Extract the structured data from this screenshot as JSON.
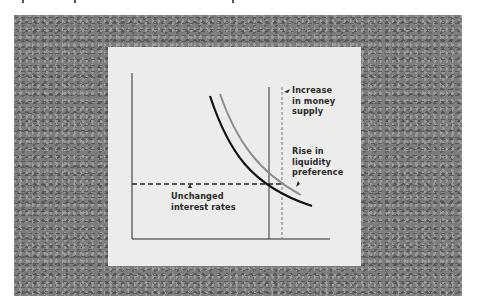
{
  "figure": {
    "type": "liquidity-trap diagram",
    "labels": {
      "money_supply": "Increase\nin money\nsupply",
      "liquidity": "Rise in\nliquidity\npreference",
      "interest": "Unchanged\ninterest rates"
    },
    "elements": {
      "original_demand_curve": "black downward-sloping curve",
      "shifted_demand_curve": "gray downward-sloping curve (shifted right)",
      "original_supply_line": "solid vertical line",
      "increased_supply_line": "dashed vertical line",
      "interest_rate_line": "dashed horizontal line"
    },
    "colors": {
      "frame": "#7d7d7d",
      "panel": "#ececea",
      "ink": "#1a1a1a",
      "gray_curve": "#8a8a8a"
    }
  }
}
